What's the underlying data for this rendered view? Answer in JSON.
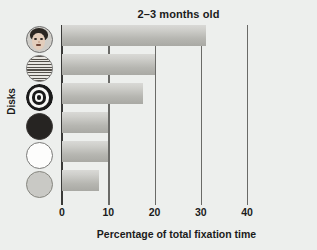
{
  "chart_data": {
    "type": "bar",
    "orientation": "horizontal",
    "title": "2–3 months old",
    "xlabel": "Percentage of total fixation time",
    "ylabel": "Disks",
    "xlim": [
      0,
      40
    ],
    "xticks": [
      0,
      10,
      20,
      30,
      40
    ],
    "xtick_labels": [
      "0",
      "10",
      "20",
      "30",
      "40"
    ],
    "grid": true,
    "legend": "none",
    "categories": [
      "face",
      "newsprint",
      "bullseye",
      "black",
      "white",
      "gray"
    ],
    "category_labels": [
      "Face disk",
      "Newsprint disk",
      "Bullseye disk",
      "Black disk",
      "White disk",
      "Gray disk"
    ],
    "values": [
      31.2,
      20.0,
      17.5,
      10.0,
      10.0,
      8.0
    ],
    "bars": [
      {
        "name": "face",
        "label": "Face disk",
        "value": 31.2
      },
      {
        "name": "newsprint",
        "label": "Newsprint disk",
        "value": 20.0
      },
      {
        "name": "bullseye",
        "label": "Bullseye disk",
        "value": 17.5
      },
      {
        "name": "black",
        "label": "Black disk",
        "value": 10.0
      },
      {
        "name": "white",
        "label": "White disk",
        "value": 10.0
      },
      {
        "name": "gray",
        "label": "Gray disk",
        "value": 8.0
      }
    ]
  },
  "colors": {
    "background": "#edefed",
    "bar_light": "#d9d9d6",
    "bar_dark": "#a9a9a4",
    "axis": "#3a3a38",
    "grid": "#6a6a67",
    "text": "#1b1b1b"
  },
  "icons": {
    "face": "face-disk-icon",
    "newsprint": "newsprint-disk-icon",
    "bullseye": "bullseye-disk-icon",
    "black": "black-disk-icon",
    "white": "white-disk-icon",
    "gray": "gray-disk-icon"
  }
}
